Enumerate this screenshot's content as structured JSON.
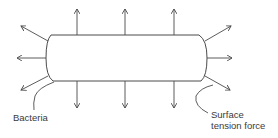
{
  "diagram": {
    "labels": {
      "bacteria": "Bacteria",
      "surface_tension_line1": "Surface",
      "surface_tension_line2": "tension force"
    },
    "colors": {
      "stroke": "#4a4a4a",
      "text": "#3a3a3a",
      "background": "#ffffff"
    },
    "arrows": {
      "top_count": 3,
      "bottom_count": 3,
      "left_count": 3,
      "right_count": 3
    }
  }
}
